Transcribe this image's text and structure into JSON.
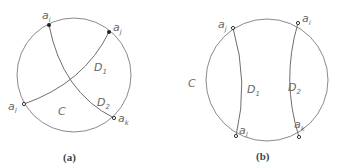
{
  "figure_a": {
    "caption": "(a)",
    "region_labels": {
      "C": "C",
      "D1_main": "D",
      "D1_sub": "1",
      "D2_main": "D",
      "D2_sub": "2"
    },
    "points": {
      "ai_main": "a",
      "ai_sub": "i",
      "aj_main": "a",
      "aj_sub": "j",
      "al_main": "a",
      "al_sub": "l",
      "ak_main": "a",
      "ak_sub": "k"
    }
  },
  "figure_b": {
    "caption": "(b)",
    "region_labels": {
      "C": "C",
      "D1_main": "D",
      "D1_sub": "1",
      "D2_main": "D",
      "D2_sub": "2"
    },
    "points": {
      "aj_main": "a",
      "aj_sub": "j",
      "ai_main": "a",
      "ai_sub": "i",
      "al_main": "a",
      "al_sub": "l",
      "ak_main": "a",
      "ak_sub": "k"
    }
  },
  "colors": {
    "stroke": "#8a8a8a",
    "text": "#666666"
  }
}
